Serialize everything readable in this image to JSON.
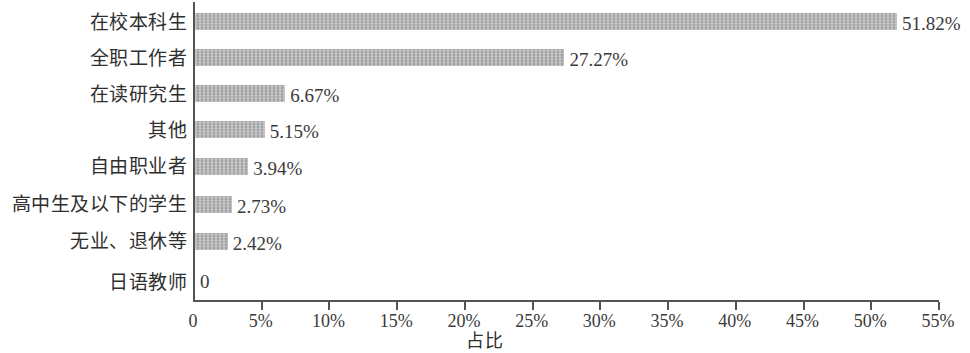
{
  "chart_data": {
    "type": "bar",
    "orientation": "horizontal",
    "title": "",
    "xlabel": "占比",
    "ylabel": "",
    "categories": [
      "在校本科生",
      "全职工作者",
      "在读研究生",
      "其他",
      "自由职业者",
      "高中生及以下的学生",
      "无业、退休等",
      "日语教师"
    ],
    "values": [
      51.82,
      27.27,
      6.67,
      5.15,
      3.94,
      2.73,
      2.42,
      0
    ],
    "value_labels": [
      "51.82%",
      "27.27%",
      "6.67%",
      "5.15%",
      "3.94%",
      "2.73%",
      "2.42%",
      "0"
    ],
    "xlim": [
      0,
      55
    ],
    "xticks": [
      0,
      5,
      10,
      15,
      20,
      25,
      30,
      35,
      40,
      45,
      50,
      55
    ],
    "xtick_labels": [
      "0",
      "5%",
      "10%",
      "15%",
      "20%",
      "25%",
      "30%",
      "35%",
      "40%",
      "45%",
      "50%",
      "55%"
    ],
    "grid": false,
    "legend": false,
    "bar_color": "#b3b3b3",
    "axis_color": "#545454",
    "text_color": "#3a3a3a",
    "background": "#ffffff"
  }
}
